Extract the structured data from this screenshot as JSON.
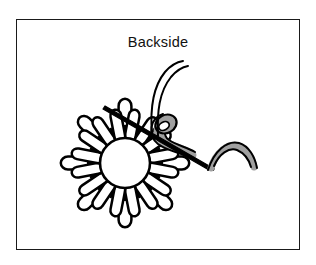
{
  "figure": {
    "caption": "Backside",
    "illustration_name": "woven-loop-flower-stitch-backside"
  },
  "colors": {
    "background": "#ffffff",
    "frame_border": "#1a1a1a",
    "ink": "#000000",
    "thread_fill": "#a0a0a0",
    "needle": "#000000",
    "center_fill": "#ffffff"
  },
  "frame": {
    "x": 16,
    "y": 19,
    "width": 284,
    "height": 231,
    "border_width": 1.4
  },
  "flower": {
    "center_x": 125,
    "center_y": 163,
    "inner_radius": 25,
    "petal_count": 16,
    "inner_loop_length": 24,
    "outer_loop_length": 30,
    "outer_loop_count": 8
  },
  "needle": {
    "start_x": 105,
    "start_y": 107,
    "end_x": 213,
    "end_y": 169,
    "width": 4.2
  },
  "thread": {
    "top_curve_label": "thread-going-up",
    "tail_curve_label": "thread-tail-right",
    "eye_loop_label": "thread-at-needle-eye"
  }
}
